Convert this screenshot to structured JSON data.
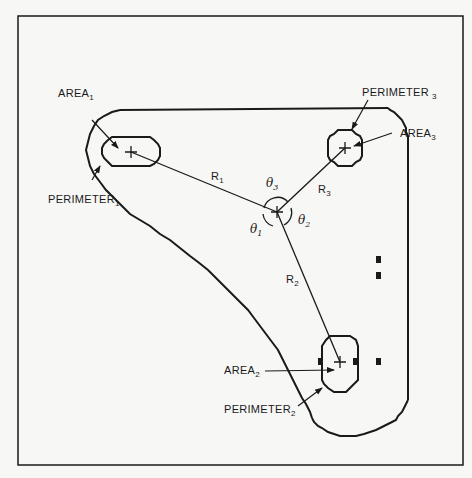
{
  "diagram": {
    "type": "geometric-shape-analysis",
    "frame": {
      "x": 18,
      "y": 16,
      "width": 445,
      "height": 449
    },
    "colors": {
      "ink": "#1a1a1a",
      "background": "#f7f7f5"
    },
    "centroid": {
      "x": 277,
      "y": 212,
      "label": "+"
    },
    "regions": [
      {
        "id": "1",
        "center": {
          "x": 131,
          "y": 152
        },
        "area_label": "AREA",
        "area_sub": "1",
        "perimeter_label": "PERIMETER",
        "perimeter_sub": "1"
      },
      {
        "id": "2",
        "center": {
          "x": 340,
          "y": 362
        },
        "area_label": "AREA",
        "area_sub": "2",
        "perimeter_label": "PERIMETER",
        "perimeter_sub": "2"
      },
      {
        "id": "3",
        "center": {
          "x": 345,
          "y": 148
        },
        "area_label": "AREA",
        "area_sub": "3",
        "perimeter_label": "PERIMETER",
        "perimeter_sub": "3"
      }
    ],
    "radii": [
      {
        "label": "R",
        "sub": "1"
      },
      {
        "label": "R",
        "sub": "2"
      },
      {
        "label": "R",
        "sub": "3"
      }
    ],
    "angles": [
      {
        "label": "θ",
        "sub": "1"
      },
      {
        "label": "θ",
        "sub": "2"
      },
      {
        "label": "θ",
        "sub": "3"
      }
    ],
    "markers_count": 5
  }
}
